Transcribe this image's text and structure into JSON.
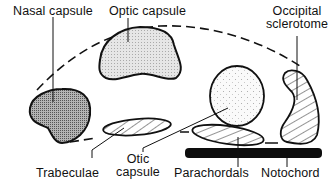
{
  "diagram": {
    "type": "anatomical-schematic",
    "labels": {
      "nasal_capsule": "Nasal capsule",
      "optic_capsule": "Optic capsule",
      "occipital_sclerotome_line1": "Occipital",
      "occipital_sclerotome_line2": "sclerotome",
      "trabeculae": "Trabeculae",
      "otic_capsule_line1": "Otic",
      "otic_capsule_line2": "capsule",
      "parachordals": "Parachordals",
      "notochord": "Notochord"
    },
    "structures": [
      {
        "name": "Nasal capsule",
        "fill": "dense-stipple"
      },
      {
        "name": "Optic capsule",
        "fill": "light-stipple"
      },
      {
        "name": "Otic capsule",
        "fill": "fine-dots"
      },
      {
        "name": "Occipital sclerotome",
        "fill": "diagonal-hatch"
      },
      {
        "name": "Trabeculae",
        "fill": "diagonal-hatch"
      },
      {
        "name": "Parachordals",
        "fill": "diagonal-hatch"
      },
      {
        "name": "Notochord",
        "fill": "solid-black"
      }
    ],
    "outline": "dashed skull outline"
  },
  "colors": {
    "stroke": "#111111",
    "nasal_fill": "#8c8c8c",
    "optic_fill": "#dcdcdc",
    "otic_fill": "#f4f4f4",
    "background": "#ffffff"
  }
}
